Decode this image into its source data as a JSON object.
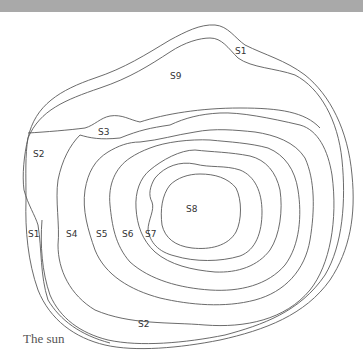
{
  "diagram": {
    "caption": "The sun",
    "regions": [
      {
        "id": "S1",
        "label": "S1"
      },
      {
        "id": "S1b",
        "label": "S1"
      },
      {
        "id": "S2",
        "label": "S2"
      },
      {
        "id": "S2b",
        "label": "S2"
      },
      {
        "id": "S3",
        "label": "S3"
      },
      {
        "id": "S4",
        "label": "S4"
      },
      {
        "id": "S5",
        "label": "S5"
      },
      {
        "id": "S6",
        "label": "S6"
      },
      {
        "id": "S7",
        "label": "S7"
      },
      {
        "id": "S8",
        "label": "S8"
      },
      {
        "id": "S9",
        "label": "S9"
      }
    ],
    "colors": {
      "line": "#5a5a5a",
      "topbar": "#a9a9a9",
      "background": "#ffffff"
    }
  }
}
